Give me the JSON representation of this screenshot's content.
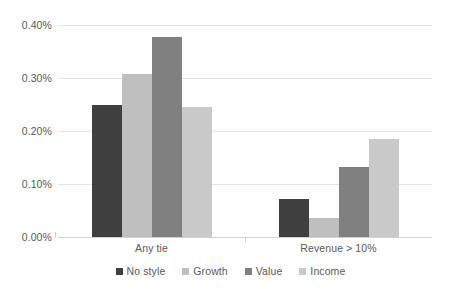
{
  "chart_data": {
    "type": "bar",
    "title": "",
    "xlabel": "",
    "ylabel": "",
    "categories": [
      "Any tie",
      "Revenue > 10%"
    ],
    "series": [
      {
        "name": "No style",
        "color": "#3f3f3f",
        "values": [
          0.25,
          0.072
        ]
      },
      {
        "name": "Growth",
        "color": "#bfbfbf",
        "values": [
          0.308,
          0.035
        ]
      },
      {
        "name": "Value",
        "color": "#808080",
        "values": [
          0.378,
          0.133
        ]
      },
      {
        "name": "Income",
        "color": "#c9c9c9",
        "values": [
          0.245,
          0.185
        ]
      }
    ],
    "ylim": [
      0,
      0.4
    ],
    "ytick_values": [
      0.0,
      0.1,
      0.2,
      0.3,
      0.4
    ],
    "ytick_labels": [
      "0.00%",
      "0.10%",
      "0.20%",
      "0.30%",
      "0.40%"
    ],
    "grid": true,
    "legend_position": "bottom",
    "value_format": "percent"
  },
  "axis": {
    "y_labels": [
      "0.40%",
      "0.30%",
      "0.20%",
      "0.10%",
      "0.00%"
    ],
    "x_labels": [
      "Any tie",
      "Revenue > 10%"
    ]
  },
  "legend": {
    "items": [
      {
        "label": "No style",
        "color": "#3f3f3f"
      },
      {
        "label": "Growth",
        "color": "#bfbfbf"
      },
      {
        "label": "Value",
        "color": "#808080"
      },
      {
        "label": "Income",
        "color": "#c9c9c9"
      }
    ]
  },
  "colors": {
    "gridline": "#e4e4e4",
    "axis": "#d0d0d0",
    "text": "#595959",
    "background": "#ffffff"
  }
}
